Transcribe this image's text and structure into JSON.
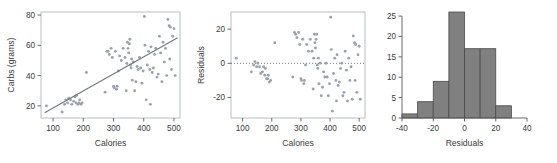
{
  "figure": {
    "panel_count": 3,
    "point_color": "#9aa3ad",
    "line_color": "#6f7780",
    "frame_color": "#b9bec4",
    "bar_fill": "#808080",
    "bar_stroke": "#4a4a4a",
    "axis_color": "#5a5a5a"
  },
  "chart_data": [
    {
      "type": "scatter",
      "name": "carbs-vs-calories",
      "title": "",
      "xlabel": "Calories",
      "ylabel": "Carbs (grams)",
      "xlim": [
        60,
        520
      ],
      "ylim": [
        12,
        82
      ],
      "xticks": [
        100,
        200,
        300,
        400,
        500
      ],
      "yticks": [
        20,
        40,
        60,
        80
      ],
      "grid": false,
      "legend": "none",
      "frame": "box",
      "trendline": {
        "x": [
          72,
          512
        ],
        "y": [
          15.5,
          65.0
        ],
        "style": "solid"
      },
      "x": [
        78,
        130,
        138,
        142,
        148,
        152,
        158,
        162,
        168,
        172,
        176,
        178,
        182,
        186,
        188,
        192,
        196,
        210,
        272,
        278,
        282,
        286,
        292,
        296,
        300,
        302,
        306,
        310,
        312,
        316,
        320,
        326,
        332,
        338,
        342,
        344,
        346,
        348,
        350,
        352,
        354,
        356,
        358,
        360,
        362,
        366,
        370,
        374,
        378,
        382,
        386,
        390,
        394,
        398,
        402,
        404,
        408,
        412,
        416,
        420,
        422,
        424,
        428,
        432,
        436,
        440,
        444,
        448,
        452,
        456,
        460,
        464,
        468,
        472,
        476,
        480,
        484,
        486,
        488,
        492,
        496,
        500,
        504
      ],
      "y": [
        20,
        16,
        21,
        24,
        22,
        25,
        24,
        21,
        23,
        26,
        22,
        27,
        21,
        22,
        24,
        21,
        22,
        42,
        29,
        56,
        56,
        54,
        58,
        52,
        33,
        32,
        56,
        31,
        33,
        43,
        53,
        50,
        58,
        52,
        30,
        48,
        62,
        58,
        55,
        61,
        64,
        47,
        45,
        51,
        37,
        49,
        30,
        36,
        46,
        44,
        52,
        45,
        35,
        43,
        79,
        60,
        24,
        47,
        56,
        44,
        21,
        59,
        42,
        45,
        54,
        58,
        39,
        41,
        66,
        55,
        36,
        62,
        49,
        58,
        40,
        77,
        73,
        51,
        72,
        44,
        66,
        71,
        40
      ]
    },
    {
      "type": "scatter",
      "name": "residuals-vs-calories",
      "title": "",
      "xlabel": "Calories",
      "ylabel": "Residuals",
      "xlim": [
        60,
        520
      ],
      "ylim": [
        -32,
        30
      ],
      "xticks": [
        100,
        200,
        300,
        400,
        500
      ],
      "yticks": [
        -20,
        0,
        20
      ],
      "grid": false,
      "legend": "none",
      "frame": "box",
      "zeroline": {
        "y": 0,
        "style": "dotted"
      },
      "x": [
        78,
        130,
        138,
        142,
        148,
        152,
        158,
        162,
        168,
        172,
        176,
        178,
        182,
        186,
        188,
        192,
        196,
        210,
        272,
        278,
        282,
        286,
        292,
        296,
        300,
        302,
        306,
        310,
        312,
        316,
        320,
        326,
        332,
        338,
        342,
        344,
        346,
        348,
        350,
        352,
        354,
        356,
        358,
        360,
        362,
        366,
        370,
        374,
        378,
        382,
        386,
        390,
        394,
        398,
        402,
        404,
        408,
        412,
        416,
        420,
        422,
        424,
        428,
        432,
        436,
        440,
        444,
        448,
        452,
        456,
        460,
        464,
        468,
        472,
        476,
        480,
        484,
        486,
        488,
        492,
        496,
        500,
        504
      ],
      "y": [
        3,
        -5,
        -1,
        1,
        -2,
        0,
        -2,
        -6,
        -5,
        -2,
        -7,
        -3,
        -9,
        -9,
        -7,
        -11,
        -10,
        12,
        -8,
        18,
        17,
        15,
        18,
        11,
        -9,
        -10,
        14,
        -12,
        -10,
        -1,
        11,
        7,
        14,
        7,
        -15,
        3,
        17,
        12,
        9,
        14,
        17,
        -1,
        -3,
        3,
        -12,
        0,
        -19,
        -14,
        -5,
        -8,
        0,
        -8,
        -19,
        -12,
        27,
        8,
        -28,
        -6,
        3,
        -10,
        -22,
        5,
        -13,
        -11,
        -3,
        0,
        -19,
        -17,
        7,
        -4,
        -22,
        3,
        -10,
        -2,
        -21,
        16,
        12,
        -10,
        11,
        -17,
        5,
        10,
        -21
      ]
    },
    {
      "type": "bar",
      "name": "residuals-histogram",
      "title": "",
      "xlabel": "Residuals",
      "ylabel": "",
      "xlim": [
        -40,
        40
      ],
      "ylim": [
        0,
        26
      ],
      "xticks": [
        -40,
        -20,
        0,
        20,
        40
      ],
      "yticks": [
        0,
        5,
        10,
        15,
        20,
        25
      ],
      "grid": false,
      "legend": "none",
      "frame": "none",
      "bin_width": 10,
      "bin_edges": [
        -40,
        -30,
        -20,
        -10,
        0,
        10,
        20,
        30
      ],
      "categories": [
        "-40 to -30",
        "-30 to -20",
        "-20 to -10",
        "-10 to 0",
        "0 to 10",
        "10 to 20",
        "20 to 30"
      ],
      "values": [
        1,
        4,
        9,
        26,
        17,
        17,
        3
      ]
    }
  ]
}
